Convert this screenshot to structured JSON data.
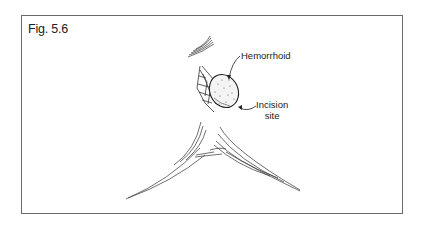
{
  "figure": {
    "caption": "Fig. 5.6",
    "labels": {
      "hemorrhoid": "Hemorrhoid",
      "incision_line1": "Incision",
      "incision_line2": "site"
    },
    "colors": {
      "frame": "#6a6a6a",
      "ink": "#222222",
      "background": "#ffffff"
    }
  }
}
